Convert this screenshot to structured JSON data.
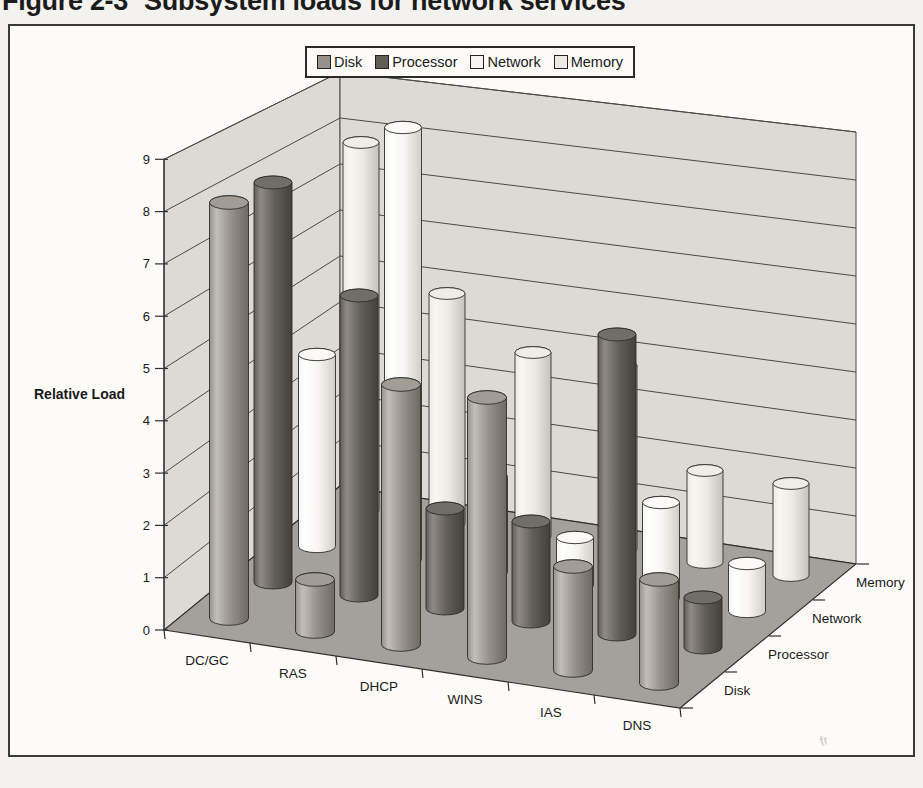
{
  "header": {
    "figure_label": "Figure 2-3",
    "figure_title": "Subsystem loads for network services"
  },
  "artifact_text": "fr",
  "chart_data": {
    "type": "bar",
    "subtype": "3d-cylinder",
    "title": "Subsystem loads for network services",
    "xlabel": "",
    "ylabel": "Relative Load",
    "ylim": [
      0,
      9
    ],
    "yticks": [
      0,
      1,
      2,
      3,
      4,
      5,
      6,
      7,
      8,
      9
    ],
    "grid": true,
    "legend_position": "top-center",
    "categories": [
      "DC/GC",
      "RAS",
      "DHCP",
      "WINS",
      "IAS",
      "DNS"
    ],
    "depth_axis_labels_front_to_back": [
      "Disk",
      "Processor",
      "Network",
      "Memory"
    ],
    "series": [
      {
        "name": "Disk",
        "values": [
          8,
          1,
          5,
          5,
          2,
          2
        ],
        "color": "#96928a",
        "top_color": "#a19d95",
        "dark_color": "#6e6a62",
        "light_color": "#c2bfb8"
      },
      {
        "name": "Processor",
        "values": [
          8,
          6,
          2,
          2,
          6,
          1
        ],
        "color": "#615e58",
        "top_color": "#716e68",
        "dark_color": "#44413c",
        "light_color": "#8f8b84"
      },
      {
        "name": "Network",
        "values": [
          4,
          9,
          2,
          1,
          2,
          1
        ],
        "color": "#f6f5f1",
        "top_color": "#fbfaf6",
        "dark_color": "#cfcdc7",
        "light_color": "#ffffff"
      },
      {
        "name": "Memory",
        "values": [
          8,
          5,
          4,
          4,
          2,
          2
        ],
        "color": "#eceae4",
        "top_color": "#efede8",
        "dark_color": "#c4c2bb",
        "light_color": "#f7f6f2"
      }
    ],
    "style_colors": {
      "wall": "#dcdad5",
      "wall_line": "#4a4a46",
      "floor": "#a3a19b",
      "axis": "#2e2e2c",
      "text": "#1a1a19",
      "panel_bg": "#fcfbf8",
      "page_bg": "#f3f2ee"
    }
  }
}
